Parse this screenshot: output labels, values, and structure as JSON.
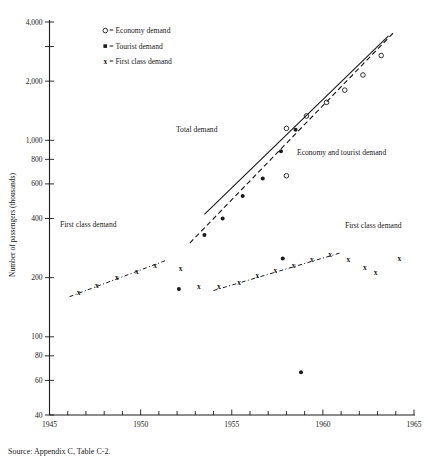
{
  "figure": {
    "source_note": "Source: Appendix C, Table C-2."
  },
  "legend": {
    "position": "top-center",
    "items": [
      {
        "symbol": "o",
        "sep": "=",
        "label": "Economy demand",
        "marker": "open-circle"
      },
      {
        "symbol": "▪",
        "sep": "=",
        "label": "Tourist demand",
        "marker": "filled-square"
      },
      {
        "symbol": "x",
        "sep": "=",
        "label": "First  class demand",
        "marker": "x-cross"
      }
    ]
  },
  "annotations": [
    {
      "text": "Total demand",
      "x": 176,
      "y": 132
    },
    {
      "text": "Economy and tourist demand",
      "x": 297,
      "y": 155
    },
    {
      "text": "First class demand",
      "x": 60,
      "y": 227
    },
    {
      "text": "First class demand",
      "x": 345,
      "y": 228
    }
  ],
  "chart_data": {
    "type": "scatter",
    "title": "",
    "subtitle": "",
    "xlabel": "",
    "ylabel": "Number of passengers (thousands)",
    "xscale": "linear",
    "yscale": "log",
    "grid": false,
    "xlim": [
      1945,
      1965
    ],
    "ylim": [
      40,
      4000
    ],
    "xticks_major": [
      1945,
      1950,
      1955,
      1960,
      1965
    ],
    "xticks_major_labels": [
      "1945",
      "1950",
      "1955",
      "1960",
      "1965"
    ],
    "xticks_minor": [
      1946,
      1947,
      1948,
      1949,
      1951,
      1952,
      1953,
      1954,
      1956,
      1957,
      1958,
      1959,
      1961,
      1962,
      1963,
      1964
    ],
    "yticks": [
      40,
      60,
      80,
      100,
      200,
      400,
      600,
      800,
      1000,
      2000,
      3000,
      4000
    ],
    "ytick_labels": [
      "40",
      "60",
      "80",
      "100",
      "200",
      "400",
      "600",
      "800",
      "1,000",
      "2,000",
      "",
      "4,000"
    ],
    "series": [
      {
        "name": "Economy demand",
        "marker": "open-circle",
        "points": [
          {
            "x": 1958.0,
            "y": 660
          },
          {
            "x": 1958.0,
            "y": 1150
          },
          {
            "x": 1959.1,
            "y": 1330
          },
          {
            "x": 1960.2,
            "y": 1560
          },
          {
            "x": 1961.2,
            "y": 1800
          },
          {
            "x": 1962.2,
            "y": 2150
          },
          {
            "x": 1963.2,
            "y": 2700
          }
        ]
      },
      {
        "name": "Tourist demand",
        "marker": "filled-square",
        "points": [
          {
            "x": 1952.1,
            "y": 175
          },
          {
            "x": 1953.5,
            "y": 330
          },
          {
            "x": 1954.5,
            "y": 400
          },
          {
            "x": 1955.6,
            "y": 520
          },
          {
            "x": 1956.7,
            "y": 640
          },
          {
            "x": 1957.7,
            "y": 880
          },
          {
            "x": 1958.5,
            "y": 1130
          },
          {
            "x": 1957.8,
            "y": 250
          },
          {
            "x": 1958.8,
            "y": 66
          }
        ]
      },
      {
        "name": "First class demand",
        "marker": "x-cross",
        "points": [
          {
            "x": 1946.6,
            "y": 168
          },
          {
            "x": 1947.6,
            "y": 182
          },
          {
            "x": 1948.7,
            "y": 200
          },
          {
            "x": 1949.8,
            "y": 215
          },
          {
            "x": 1950.8,
            "y": 232
          },
          {
            "x": 1952.2,
            "y": 222
          },
          {
            "x": 1953.2,
            "y": 180
          },
          {
            "x": 1954.3,
            "y": 180
          },
          {
            "x": 1955.4,
            "y": 190
          },
          {
            "x": 1956.4,
            "y": 205
          },
          {
            "x": 1957.4,
            "y": 218
          },
          {
            "x": 1958.4,
            "y": 232
          },
          {
            "x": 1959.4,
            "y": 248
          },
          {
            "x": 1960.4,
            "y": 262
          },
          {
            "x": 1961.4,
            "y": 248
          },
          {
            "x": 1962.3,
            "y": 226
          },
          {
            "x": 1962.9,
            "y": 212
          },
          {
            "x": 1964.2,
            "y": 250
          }
        ]
      }
    ],
    "trendlines": [
      {
        "name": "Total demand",
        "style": "solid",
        "x0": 1953.5,
        "y0": 420,
        "x1": 1963.6,
        "y1": 3400
      },
      {
        "name": "Economy and tourist demand",
        "style": "dashed",
        "x0": 1952.7,
        "y0": 300,
        "x1": 1963.9,
        "y1": 3550
      },
      {
        "name": "First class demand (early)",
        "style": "dash-dot",
        "x0": 1946.1,
        "y0": 160,
        "x1": 1951.4,
        "y1": 245
      },
      {
        "name": "First class demand (late)",
        "style": "dash-dot",
        "x0": 1954.0,
        "y0": 172,
        "x1": 1961.0,
        "y1": 268
      }
    ]
  }
}
